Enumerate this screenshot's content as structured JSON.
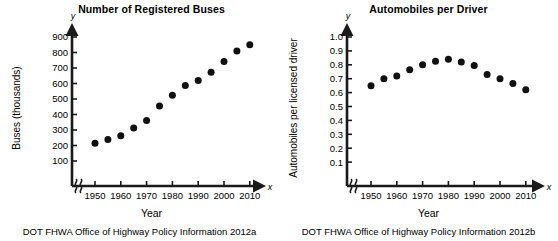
{
  "figure": {
    "background": "#ffffff",
    "marker_color": "#111111",
    "axis_color": "#1a1a1a"
  },
  "panels": [
    {
      "id": "registered-buses",
      "caption": "DOT FHWA Office of Highway Policy Information 2012a",
      "x_axis_name": "Year",
      "x_letter": "x",
      "y_letter": "y",
      "axis_break": true
    },
    {
      "id": "automobiles-per-driver",
      "caption": "DOT FHWA Office of Highway Policy Information 2012b",
      "x_axis_name": "Year",
      "x_letter": "x",
      "y_letter": "y",
      "axis_break": true
    }
  ],
  "chart_data": [
    {
      "type": "scatter",
      "title": "Number of Registered Buses",
      "xlabel": "Year",
      "ylabel": "Buses (thousands)",
      "xlim": [
        1945,
        2015
      ],
      "ylim": [
        0,
        950
      ],
      "xticks": [
        1950,
        1960,
        1970,
        1980,
        1990,
        2000,
        2010
      ],
      "xtick_labels": [
        "1950",
        "1960",
        "1970",
        "1980",
        "1990",
        "2000",
        "2010"
      ],
      "yticks": [
        100,
        200,
        300,
        400,
        500,
        600,
        700,
        800,
        900
      ],
      "ytick_labels": [
        "100",
        "200",
        "300",
        "400",
        "500",
        "600",
        "700",
        "800",
        "900"
      ],
      "grid": false,
      "legend": false,
      "axis_break_x": true,
      "x": [
        1950,
        1955,
        1960,
        1965,
        1970,
        1975,
        1980,
        1985,
        1990,
        1995,
        2000,
        2005,
        2010
      ],
      "values": [
        215,
        238,
        263,
        313,
        362,
        455,
        525,
        587,
        620,
        672,
        742,
        810,
        850
      ]
    },
    {
      "type": "scatter",
      "title": "Automobiles per Driver",
      "xlabel": "Year",
      "ylabel": "Automobiles per licensed driver",
      "xlim": [
        1945,
        2015
      ],
      "ylim": [
        0,
        1.05
      ],
      "xticks": [
        1950,
        1960,
        1970,
        1980,
        1990,
        2000,
        2010
      ],
      "xtick_labels": [
        "1950",
        "1960",
        "1970",
        "1980",
        "1990",
        "2000",
        "2010"
      ],
      "yticks": [
        0.1,
        0.2,
        0.3,
        0.4,
        0.5,
        0.6,
        0.7,
        0.8,
        0.9,
        1.0
      ],
      "ytick_labels": [
        "0.1",
        "0.2",
        "0.3",
        "0.4",
        "0.5",
        "0.6",
        "0.7",
        "0.8",
        "0.9",
        "1.0"
      ],
      "grid": false,
      "legend": false,
      "axis_break_x": true,
      "x": [
        1950,
        1955,
        1960,
        1965,
        1970,
        1975,
        1980,
        1985,
        1990,
        1995,
        2000,
        2005,
        2010
      ],
      "values": [
        0.65,
        0.7,
        0.72,
        0.765,
        0.8,
        0.825,
        0.84,
        0.82,
        0.795,
        0.73,
        0.7,
        0.665,
        0.62
      ]
    }
  ]
}
